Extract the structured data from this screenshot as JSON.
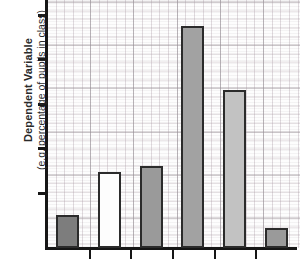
{
  "chart_data": {
    "type": "bar",
    "title": "",
    "subtitle": "",
    "ylabel": "Dependent Variable",
    "ylabel_sub": "(e.g. percentage of pupils in class)",
    "xlabel": "",
    "categories": [
      "",
      "",
      "",
      "",
      "",
      ""
    ],
    "values": [
      15,
      34,
      37,
      100,
      71,
      9
    ],
    "ylim": [
      0,
      107
    ],
    "grid": "graph-paper",
    "legend": "none",
    "axis_tick_labels_y": [
      "",
      "",
      "",
      "",
      ""
    ],
    "bars": [
      {
        "index": 1,
        "value": 15,
        "fill": "#7d7d7d",
        "edge": "#2b2b2b",
        "fill_name": "dark-gray"
      },
      {
        "index": 2,
        "value": 34,
        "fill": "#fdfdfd",
        "edge": "#2b2b2b",
        "fill_name": "white"
      },
      {
        "index": 3,
        "value": 37,
        "fill": "#9a9a9a",
        "edge": "#2b2b2b",
        "fill_name": "medium-gray"
      },
      {
        "index": 4,
        "value": 100,
        "fill": "#a2a2a2",
        "edge": "#2b2b2b",
        "fill_name": "medium-gray"
      },
      {
        "index": 5,
        "value": 71,
        "fill": "#c2c2c2",
        "edge": "#2b2b2b",
        "fill_name": "light-gray"
      },
      {
        "index": 6,
        "value": 9,
        "fill": "#9a9a9a",
        "edge": "#2b2b2b",
        "fill_name": "medium-gray"
      }
    ],
    "y_ticks_px": [
      14,
      58,
      103,
      147,
      192
    ],
    "x_tick_positions_pct": [
      16.6,
      33.3,
      50.0,
      66.6,
      83.3
    ],
    "xlabels_clipped": true,
    "xlabels": [
      "",
      "",
      "",
      "",
      "",
      ""
    ]
  },
  "colors": {
    "axis": "#161616",
    "bar_edge": "#2b2b2b",
    "paper_major_grid": "#969196",
    "paper_minor_grid": "#b4a5af",
    "text": "#2a2a2a",
    "background": "#ffffff"
  }
}
